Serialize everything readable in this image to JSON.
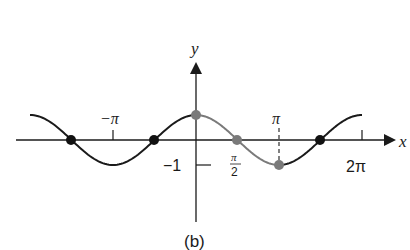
{
  "figure": {
    "caption": "(b)",
    "axes": {
      "x_label": "x",
      "y_label": "y",
      "origin_px": [
        196,
        140
      ],
      "unit_pi_px": 83,
      "amplitude_px": 25
    },
    "tick_labels": {
      "neg_pi": "−π",
      "pi": "π",
      "two_pi": "2π",
      "half_pi_num": "π",
      "half_pi_den": "2",
      "neg_one": "−1"
    },
    "colors": {
      "curve": "#1a1a1a",
      "highlight": "#7a7a7a",
      "axis": "#1a1a1a"
    },
    "curve": {
      "function": "y = cos x",
      "x_range": [
        "-2π",
        "2π"
      ],
      "highlight_range": [
        "0",
        "π"
      ]
    },
    "points": [
      {
        "label": "(-3π/2, 0)",
        "x": "-3π/2",
        "y": 0,
        "color": "black"
      },
      {
        "label": "(-π/2, 0)",
        "x": "-π/2",
        "y": 0,
        "color": "black"
      },
      {
        "label": "(0, 1)",
        "x": "0",
        "y": 1,
        "color": "gray"
      },
      {
        "label": "(π/2, 0)",
        "x": "π/2",
        "y": 0,
        "color": "gray"
      },
      {
        "label": "(π, -1)",
        "x": "π",
        "y": -1,
        "color": "gray"
      },
      {
        "label": "(3π/2, 0)",
        "x": "3π/2",
        "y": 0,
        "color": "black"
      }
    ]
  }
}
